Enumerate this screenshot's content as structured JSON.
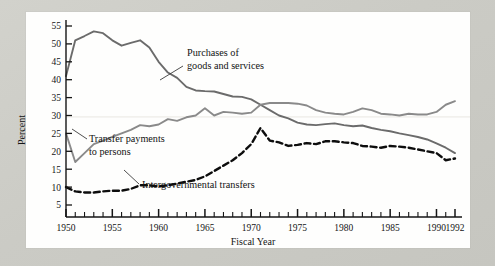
{
  "figure": {
    "background_color": "#cfcfc9",
    "panel_color": "#fefefd",
    "ylabel": "Percent",
    "xlabel": "Fiscal Year"
  },
  "annotations": {
    "purchases_line1": "Purchases of",
    "purchases_line2": "goods and services",
    "transfers_line1": "Transfer payments",
    "transfers_line2": "to persons",
    "intergov": "Intergovernmental transfers"
  },
  "chart_data": {
    "type": "line",
    "title": "",
    "xlabel": "Fiscal Year",
    "ylabel": "Percent",
    "xlim": [
      1950,
      1992
    ],
    "ylim": [
      3,
      57
    ],
    "yticks": [
      5,
      10,
      15,
      20,
      25,
      30,
      35,
      40,
      45,
      50,
      55
    ],
    "xticks": [
      1950,
      1955,
      1960,
      1965,
      1970,
      1975,
      1980,
      1985,
      1990,
      1992
    ],
    "xtick_labels": [
      "1950",
      "1955",
      "1960",
      "1965",
      "1970",
      "1975",
      "1980",
      "1985",
      "1990",
      "1992"
    ],
    "minor_xticks_every": 1,
    "grid": "single faint horizontal line near 30",
    "legend": "none (inline annotations with leader lines)",
    "x": [
      1950,
      1951,
      1952,
      1953,
      1954,
      1955,
      1956,
      1957,
      1958,
      1959,
      1960,
      1961,
      1962,
      1963,
      1964,
      1965,
      1966,
      1967,
      1968,
      1969,
      1970,
      1971,
      1972,
      1973,
      1974,
      1975,
      1976,
      1977,
      1978,
      1979,
      1980,
      1981,
      1982,
      1983,
      1984,
      1985,
      1986,
      1987,
      1988,
      1989,
      1990,
      1991,
      1992
    ],
    "series": [
      {
        "name": "Purchases of goods and services",
        "color": "#6b6b6b",
        "style": "solid",
        "values": [
          41.0,
          51.0,
          52.2,
          53.5,
          53.0,
          51.0,
          49.5,
          50.3,
          51.0,
          49.0,
          45.0,
          42.0,
          40.5,
          38.0,
          37.0,
          36.8,
          36.7,
          36.0,
          35.3,
          35.2,
          34.5,
          33.0,
          31.5,
          30.0,
          29.2,
          28.0,
          27.5,
          27.3,
          27.6,
          27.8,
          27.3,
          27.0,
          27.2,
          26.5,
          26.0,
          25.6,
          25.0,
          24.5,
          24.0,
          23.3,
          22.2,
          21.0,
          19.5
        ]
      },
      {
        "name": "Transfer payments to persons",
        "color": "#8a8a8a",
        "style": "solid",
        "values": [
          25.0,
          17.0,
          19.5,
          22.0,
          23.0,
          24.0,
          25.0,
          26.0,
          27.3,
          27.0,
          27.5,
          29.0,
          28.5,
          29.5,
          30.0,
          32.0,
          30.0,
          31.0,
          30.8,
          30.5,
          30.8,
          33.0,
          33.5,
          33.5,
          33.5,
          33.3,
          32.8,
          31.5,
          30.8,
          30.5,
          30.3,
          31.0,
          32.0,
          31.5,
          30.5,
          30.3,
          30.0,
          30.5,
          30.3,
          30.3,
          31.0,
          33.0,
          34.0
        ]
      },
      {
        "name": "Intergovernmental transfers",
        "color": "#0d0d0d",
        "style": "dashed",
        "values": [
          10.0,
          8.8,
          8.5,
          8.5,
          8.8,
          9.0,
          9.0,
          9.5,
          10.5,
          10.5,
          10.2,
          10.5,
          11.0,
          11.5,
          12.0,
          13.0,
          14.5,
          16.0,
          17.5,
          19.5,
          22.0,
          26.5,
          23.0,
          22.5,
          21.5,
          21.8,
          22.3,
          22.0,
          22.8,
          22.8,
          22.5,
          22.3,
          21.5,
          21.3,
          21.0,
          21.5,
          21.3,
          21.0,
          20.5,
          20.0,
          19.5,
          17.5,
          18.0
        ]
      }
    ]
  }
}
